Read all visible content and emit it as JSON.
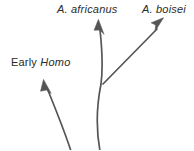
{
  "figure": {
    "type": "phylogenetic-branching-diagram",
    "background_color": "#ffffff",
    "stroke_color": "#555555",
    "text_color": "#2b2b2b"
  },
  "labels": {
    "africanus": {
      "genus_abbrev": "A.",
      "species": "africanus",
      "full": "A. africanus"
    },
    "boisei": {
      "genus_abbrev": "A.",
      "species": "boisei",
      "full": "A. boisei"
    },
    "early_homo": {
      "qualifier": "Early",
      "genus": "Homo",
      "full": "Early Homo"
    }
  },
  "branches": [
    {
      "name": "early-homo-branch",
      "label": "Early Homo",
      "shape": "curved",
      "direction": "up-left",
      "arrowhead": true
    },
    {
      "name": "africanus-branch",
      "label": "A. africanus",
      "shape": "curved",
      "direction": "up",
      "arrowhead": true
    },
    {
      "name": "boisei-branch",
      "label": "A. boisei",
      "shape": "straight",
      "direction": "up-right",
      "arrowhead": true
    }
  ]
}
